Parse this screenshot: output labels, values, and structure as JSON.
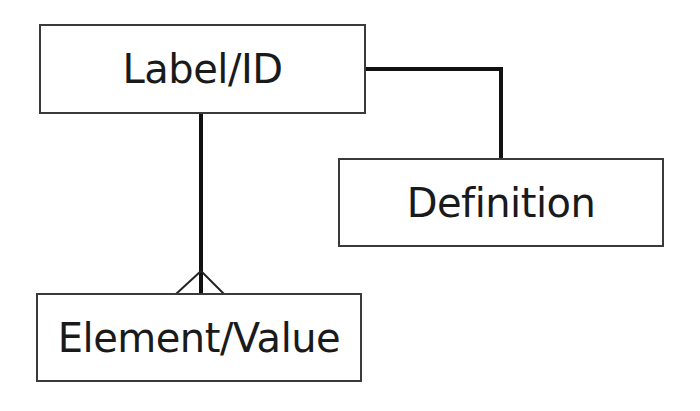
{
  "diagram": {
    "type": "entity-relationship",
    "entities": [
      {
        "id": "label",
        "label": "Label/ID"
      },
      {
        "id": "definition",
        "label": "Definition"
      },
      {
        "id": "element",
        "label": "Element/Value"
      }
    ],
    "relationships": [
      {
        "from": "label",
        "to": "definition",
        "cardinality": "one-to-one",
        "style": "elbow-connector"
      },
      {
        "from": "label",
        "to": "element",
        "cardinality": "one-to-many",
        "end_marker": "crows-foot-icon"
      }
    ],
    "colors": {
      "line": "#111111",
      "box_border": "#3a3a3a",
      "text": "#1a1a1a",
      "background": "#ffffff"
    }
  }
}
